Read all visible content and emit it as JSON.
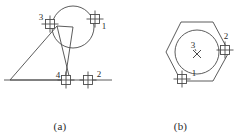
{
  "document": {
    "title": "Welding point location figures",
    "background_color": "#ffffff",
    "line_color": "#4a4a4a",
    "text_color": "#2b2b2b"
  },
  "figures": [
    {
      "id": "a",
      "caption": "(a)",
      "description": "Triangle with tangent circle and four crosshair markers",
      "shapes": {
        "baseline": {
          "x1": 4,
          "y1": 80,
          "x2": 112,
          "y2": 80
        },
        "triangle": {
          "points": "10,80 57,26 70,80"
        },
        "circle": {
          "cx": 73,
          "cy": 27,
          "r": 21
        },
        "radius_line": {
          "x1": 73,
          "y1": 27,
          "x2": 57,
          "y2": 26
        },
        "chord_line": {
          "x1": 73,
          "y1": 27,
          "x2": 65,
          "y2": 80
        }
      },
      "markers": [
        {
          "label": "1",
          "x": 95,
          "y": 19,
          "label_dx": 9,
          "label_dy": 10
        },
        {
          "label": "3",
          "x": 50,
          "y": 24,
          "label_dx": -9,
          "label_dy": -4
        },
        {
          "label": "4",
          "x": 66,
          "y": 80,
          "label_dx": -8,
          "label_dy": -2
        },
        {
          "label": "2",
          "x": 88,
          "y": 80,
          "label_dx": 11,
          "label_dy": -3
        }
      ]
    },
    {
      "id": "b",
      "caption": "(b)",
      "description": "Hexagon with inscribed circle, center cross and three markers",
      "shapes": {
        "hexagon": {
          "points": "46,52 61,22 93,22 109,52 93,81 61,81"
        },
        "circle": {
          "cx": 77,
          "cy": 52,
          "r": 22
        },
        "center_cross": {
          "cx": 77,
          "cy": 54,
          "size": 4
        }
      },
      "markers": [
        {
          "label": "1",
          "x": 62,
          "y": 79,
          "label_dx": 12,
          "label_dy": -3
        },
        {
          "label": "2",
          "x": 105,
          "y": 50,
          "label_dx": 1,
          "label_dy": -11
        },
        {
          "label": "3",
          "x": null,
          "y": null,
          "label_dx": 0,
          "label_dy": 0
        }
      ],
      "center_label": {
        "text": "3",
        "x": 73,
        "y": 48
      }
    }
  ],
  "marker_style": {
    "name": "crosshair-square-marker",
    "square_size": 9,
    "tick_overhang": 4
  }
}
